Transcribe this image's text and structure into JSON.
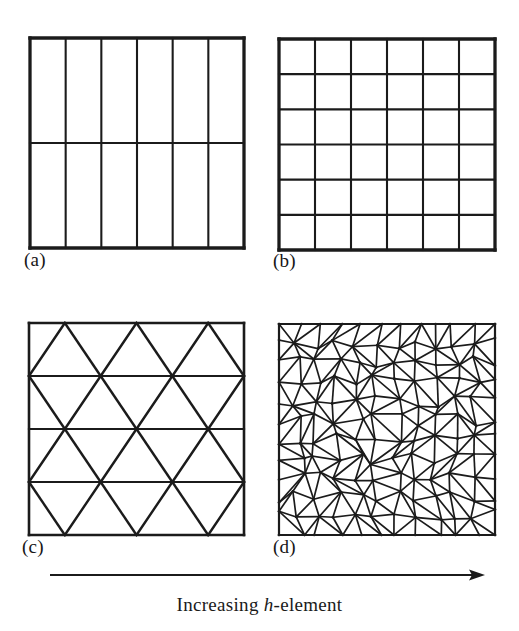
{
  "figure": {
    "type": "mesh-refinement-illustration",
    "background_color": "#ffffff",
    "line_color": "#1b1b1b",
    "caption": {
      "prefix": "Increasing ",
      "italic_symbol": "h",
      "suffix": "-element",
      "full_text": "Increasing h-element"
    },
    "arrow": {
      "name": "increasing-h-element-arrow",
      "direction": "right",
      "x_start": 10,
      "x_end": 445,
      "y": 13
    },
    "panels": [
      {
        "key": "a",
        "label": "(a)",
        "name": "mesh-panel-a",
        "description": "coarse structured quadrilateral mesh",
        "mesh_type": "quadrilateral",
        "columns": 6,
        "rows": 2,
        "left": 27,
        "top": 35,
        "width": 214,
        "height": 210,
        "label_left": 24,
        "label_top": 250
      },
      {
        "key": "b",
        "label": "(b)",
        "name": "mesh-panel-b",
        "description": "refined structured quadrilateral mesh",
        "mesh_type": "quadrilateral",
        "columns": 6,
        "rows": 6,
        "left": 276,
        "top": 36,
        "width": 216,
        "height": 211,
        "label_left": 273,
        "label_top": 251
      },
      {
        "key": "c",
        "label": "(c)",
        "name": "mesh-panel-c",
        "description": "coarse structured triangular mesh",
        "mesh_type": "triangular-structured",
        "columns": 3,
        "rows": 4,
        "left": 26,
        "top": 320,
        "width": 215,
        "height": 212,
        "label_left": 22,
        "label_top": 537
      },
      {
        "key": "d",
        "label": "(d)",
        "name": "mesh-panel-d",
        "description": "fine unstructured triangular mesh",
        "mesh_type": "triangular-unstructured",
        "columns": 11,
        "rows": 11,
        "left": 276,
        "top": 321,
        "width": 216,
        "height": 211,
        "label_left": 273,
        "label_top": 537
      }
    ]
  },
  "chart_data": {
    "type": "diagram",
    "title": "Increasing h-element",
    "series": [
      {
        "name": "(a)",
        "mesh": "quadrilateral structured",
        "elements": 12,
        "nodes_x": 7,
        "nodes_y": 3
      },
      {
        "name": "(b)",
        "mesh": "quadrilateral structured",
        "elements": 36,
        "nodes_x": 7,
        "nodes_y": 7
      },
      {
        "name": "(c)",
        "mesh": "triangular structured",
        "elements": 24,
        "nodes_x": 4,
        "nodes_y": 5
      },
      {
        "name": "(d)",
        "mesh": "triangular unstructured",
        "elements": 242,
        "nodes_x": 12,
        "nodes_y": 12
      }
    ],
    "annotations": [
      "(a)",
      "(b)",
      "(c)",
      "(d)",
      "Increasing h-element"
    ]
  }
}
